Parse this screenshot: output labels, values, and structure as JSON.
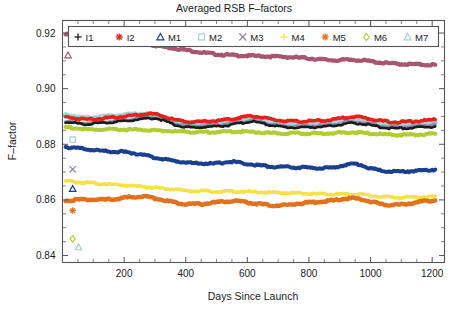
{
  "chart_data": {
    "type": "line",
    "title": "Averaged RSB F–factors",
    "xlabel": "Days Since Launch",
    "ylabel": "F–factor",
    "xlim": [
      0,
      1240
    ],
    "ylim": [
      0.8375,
      0.9245
    ],
    "xticks": [
      200,
      400,
      600,
      800,
      1000,
      1200
    ],
    "xticklabels": [
      "200",
      "400",
      "600",
      "800",
      "1000",
      "1200"
    ],
    "yticks": [
      0.84,
      0.86,
      0.88,
      0.9,
      0.92
    ],
    "yticklabels": [
      "0.84",
      "0.86",
      "0.88",
      "0.90",
      "0.92"
    ],
    "grid": false,
    "legend_position": "top-inside",
    "x": [
      10,
      40,
      70,
      100,
      130,
      160,
      190,
      220,
      250,
      280,
      310,
      340,
      370,
      400,
      430,
      460,
      490,
      520,
      550,
      580,
      610,
      640,
      670,
      700,
      730,
      760,
      790,
      820,
      850,
      880,
      910,
      940,
      970,
      1000,
      1030,
      1060,
      1090,
      1120,
      1150,
      1180,
      1210
    ],
    "series": [
      {
        "name": "I1",
        "marker": "plus",
        "color": "#1b1b1b",
        "values": [
          0.888,
          0.8876,
          0.8872,
          0.8874,
          0.8876,
          0.8879,
          0.8882,
          0.8886,
          0.889,
          0.8894,
          0.8892,
          0.888,
          0.8868,
          0.8862,
          0.886,
          0.8862,
          0.8864,
          0.8866,
          0.887,
          0.8876,
          0.8882,
          0.8878,
          0.887,
          0.8864,
          0.8861,
          0.886,
          0.8861,
          0.8862,
          0.8863,
          0.8866,
          0.8872,
          0.8876,
          0.8874,
          0.8868,
          0.8862,
          0.8858,
          0.8857,
          0.8858,
          0.886,
          0.8862,
          0.8864
        ]
      },
      {
        "name": "I2",
        "marker": "asterisk",
        "color": "#e8201a",
        "values": [
          0.8898,
          0.8894,
          0.889,
          0.8891,
          0.8893,
          0.8896,
          0.8899,
          0.8903,
          0.8907,
          0.891,
          0.8906,
          0.8896,
          0.8886,
          0.8882,
          0.888,
          0.8882,
          0.8884,
          0.8887,
          0.8891,
          0.8897,
          0.8902,
          0.8898,
          0.8891,
          0.8886,
          0.8883,
          0.8882,
          0.8883,
          0.8884,
          0.8886,
          0.8889,
          0.8895,
          0.8899,
          0.8897,
          0.8891,
          0.8885,
          0.8881,
          0.888,
          0.8881,
          0.8883,
          0.8886,
          0.8889
        ]
      },
      {
        "name": "M1",
        "marker": "triangle",
        "color": "#1a3f8f",
        "values": [
          0.879,
          0.8788,
          0.8783,
          0.8779,
          0.8776,
          0.8774,
          0.8773,
          0.877,
          0.8764,
          0.8757,
          0.875,
          0.8744,
          0.8739,
          0.8735,
          0.8732,
          0.8731,
          0.873,
          0.8734,
          0.8738,
          0.8733,
          0.8728,
          0.8724,
          0.8721,
          0.8719,
          0.8718,
          0.8717,
          0.8716,
          0.8715,
          0.8714,
          0.8716,
          0.8724,
          0.873,
          0.8726,
          0.8714,
          0.8706,
          0.8703,
          0.8702,
          0.8703,
          0.8704,
          0.8706,
          0.8709
        ]
      },
      {
        "name": "M2",
        "marker": "square",
        "color": "#a8ced6",
        "values": [
          0.8906,
          0.89,
          0.8894,
          0.8895,
          0.8898,
          0.8901,
          0.8904,
          0.8906,
          0.8908,
          0.8909,
          0.8903,
          0.889,
          0.888,
          0.8876,
          0.8874,
          0.8876,
          0.8878,
          0.888,
          0.8884,
          0.889,
          0.8895,
          0.889,
          0.8882,
          0.8876,
          0.8873,
          0.8872,
          0.8873,
          0.8874,
          0.8876,
          0.8879,
          0.8885,
          0.8889,
          0.8887,
          0.8881,
          0.8875,
          0.8871,
          0.887,
          0.8871,
          0.8873,
          0.8876,
          0.8879
        ]
      },
      {
        "name": "M3",
        "marker": "x",
        "color": "#8c8ca8",
        "values": [
          0.8884,
          0.888,
          0.8876,
          0.8878,
          0.888,
          0.8883,
          0.8886,
          0.889,
          0.8894,
          0.8897,
          0.8894,
          0.8883,
          0.8872,
          0.8867,
          0.8865,
          0.8867,
          0.8869,
          0.8871,
          0.8875,
          0.8881,
          0.8886,
          0.8882,
          0.8874,
          0.8868,
          0.8865,
          0.8864,
          0.8865,
          0.8866,
          0.8868,
          0.8871,
          0.8877,
          0.8881,
          0.8879,
          0.8873,
          0.8867,
          0.8863,
          0.8862,
          0.8863,
          0.8865,
          0.8868,
          0.8871
        ]
      },
      {
        "name": "M4",
        "marker": "plus",
        "color": "#f5e24a",
        "values": [
          0.8668,
          0.8665,
          0.8662,
          0.866,
          0.8658,
          0.8656,
          0.8654,
          0.8652,
          0.8649,
          0.8646,
          0.8643,
          0.864,
          0.8637,
          0.8634,
          0.8632,
          0.8631,
          0.863,
          0.863,
          0.8631,
          0.863,
          0.8629,
          0.8628,
          0.8627,
          0.8626,
          0.8625,
          0.8624,
          0.8623,
          0.8622,
          0.8621,
          0.862,
          0.862,
          0.8621,
          0.862,
          0.8616,
          0.8612,
          0.861,
          0.8609,
          0.8609,
          0.861,
          0.8611,
          0.8612
        ]
      },
      {
        "name": "M5",
        "marker": "asterisk",
        "color": "#e2711d",
        "values": [
          0.8598,
          0.86,
          0.8602,
          0.8601,
          0.86,
          0.8602,
          0.8606,
          0.861,
          0.8612,
          0.861,
          0.8604,
          0.8596,
          0.859,
          0.8586,
          0.8585,
          0.8586,
          0.859,
          0.8594,
          0.8596,
          0.8594,
          0.859,
          0.8585,
          0.8581,
          0.858,
          0.8582,
          0.8586,
          0.859,
          0.8592,
          0.8594,
          0.8598,
          0.8604,
          0.8606,
          0.8602,
          0.8594,
          0.8586,
          0.8582,
          0.8582,
          0.8586,
          0.8592,
          0.8596,
          0.8598
        ]
      },
      {
        "name": "M6",
        "marker": "diamond",
        "color": "#b2cc33",
        "values": [
          0.8862,
          0.8858,
          0.8854,
          0.8853,
          0.8853,
          0.8853,
          0.8853,
          0.8853,
          0.8852,
          0.8851,
          0.885,
          0.8848,
          0.8846,
          0.8845,
          0.8844,
          0.8844,
          0.8844,
          0.8845,
          0.8846,
          0.8846,
          0.8845,
          0.8843,
          0.8841,
          0.884,
          0.8839,
          0.8839,
          0.8839,
          0.8839,
          0.8839,
          0.884,
          0.8842,
          0.8843,
          0.8842,
          0.8839,
          0.8836,
          0.8834,
          0.8834,
          0.8834,
          0.8835,
          0.8836,
          0.8838
        ]
      },
      {
        "name": "M7",
        "marker": "triangle",
        "color": "#a8566f",
        "values": [
          0.9195,
          0.919,
          0.9183,
          0.9178,
          0.9175,
          0.9173,
          0.9171,
          0.9168,
          0.9164,
          0.9159,
          0.9154,
          0.9149,
          0.9144,
          0.9139,
          0.9134,
          0.9129,
          0.9125,
          0.9122,
          0.912,
          0.9119,
          0.9118,
          0.9117,
          0.9116,
          0.9115,
          0.9114,
          0.9112,
          0.911,
          0.9107,
          0.9104,
          0.9102,
          0.9103,
          0.9104,
          0.9102,
          0.9098,
          0.9094,
          0.9091,
          0.9089,
          0.9088,
          0.9087,
          0.9086,
          0.9086
        ]
      }
    ],
    "legend": [
      {
        "label": "I1",
        "marker": "plus",
        "color": "#1b1b1b"
      },
      {
        "label": "I2",
        "marker": "asterisk",
        "color": "#e8201a"
      },
      {
        "label": "M1",
        "marker": "triangle",
        "color": "#1a3f8f"
      },
      {
        "label": "M2",
        "marker": "square",
        "color": "#a8ced6"
      },
      {
        "label": "M3",
        "marker": "x",
        "color": "#8c8ca8"
      },
      {
        "label": "M4",
        "marker": "plus",
        "color": "#f5e24a"
      },
      {
        "label": "M5",
        "marker": "asterisk",
        "color": "#e2711d"
      },
      {
        "label": "M6",
        "marker": "diamond",
        "color": "#b2cc33"
      },
      {
        "label": "M7",
        "marker": "triangle",
        "color": "#a8ced6"
      }
    ]
  }
}
